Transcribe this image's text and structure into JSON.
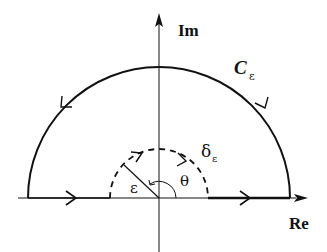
{
  "diagram": {
    "type": "contour-integral",
    "axes": {
      "real_label": "Re",
      "imag_label": "Im"
    },
    "labels": {
      "big_contour": "C",
      "big_contour_subscript": "ε",
      "small_contour": "δ",
      "small_contour_subscript": "ε",
      "radius": "ε",
      "angle": "θ"
    },
    "geometry": {
      "origin": [
        159,
        198
      ],
      "big_radius": 131,
      "small_radius": 49
    },
    "colors": {
      "stroke": "#111111",
      "background": "#ffffff"
    }
  }
}
